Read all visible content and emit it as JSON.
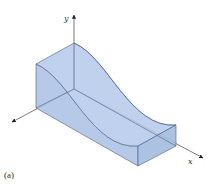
{
  "figure": {
    "caption": "(a)",
    "axes": {
      "y_label": "y",
      "x_label": "x",
      "z_label": ""
    },
    "colors": {
      "solid_fill": "#a9c0e4",
      "solid_edge": "#4a5f86",
      "axis": "#444444"
    }
  }
}
